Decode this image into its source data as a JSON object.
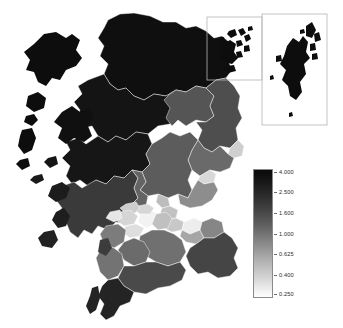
{
  "figure": {
    "type": "choropleth-map",
    "region_name": "Scotland",
    "background_color": "#ffffff",
    "polygon_border_color": "#ffffff"
  },
  "insets": [
    {
      "name": "orkney-inset",
      "x": 207,
      "y": 17,
      "width": 55,
      "height": 63,
      "border_color": "#b4b4b4"
    },
    {
      "name": "shetland-inset",
      "x": 262,
      "y": 14,
      "width": 65,
      "height": 111,
      "border_color": "#b4b4b4"
    }
  ],
  "legend": {
    "orientation": "vertical",
    "scale": "log",
    "x": 253,
    "y": 169,
    "width": 20,
    "height": 129,
    "border_color": "#8a8a8a",
    "top_color": "#0a0a0a",
    "bottom_color": "#fdfdfd",
    "ticks": [
      {
        "label": "4.000",
        "value": 4.0,
        "pos_pct": 2
      },
      {
        "label": "2.500",
        "value": 2.5,
        "pos_pct": 18
      },
      {
        "label": "1.600",
        "value": 1.6,
        "pos_pct": 34
      },
      {
        "label": "1.000",
        "value": 1.0,
        "pos_pct": 50
      },
      {
        "label": "0.625",
        "value": 0.625,
        "pos_pct": 66
      },
      {
        "label": "0.400",
        "value": 0.4,
        "pos_pct": 82
      },
      {
        "label": "0.250",
        "value": 0.25,
        "pos_pct": 97
      }
    ]
  },
  "chart_data": {
    "type": "heatmap",
    "title": "",
    "xlabel": "",
    "ylabel": "",
    "colorbar_label": "",
    "color_scale": "log",
    "vmin": 0.25,
    "vmax": 4.0,
    "colormap": "greys-reversed",
    "legend_position": "right",
    "grid": false,
    "tick_labels": [
      "4.000",
      "2.500",
      "1.600",
      "1.000",
      "0.625",
      "0.400",
      "0.250"
    ],
    "tick_values": [
      4.0,
      2.5,
      1.6,
      1.0,
      0.625,
      0.4,
      0.25
    ],
    "regions": [
      {
        "name": "Shetland Islands",
        "value": 4.0,
        "shade": "#0d0d0d"
      },
      {
        "name": "Orkney Islands",
        "value": 4.0,
        "shade": "#0d0d0d"
      },
      {
        "name": "Na h-Eileanan Siar",
        "value": 4.0,
        "shade": "#0d0d0d"
      },
      {
        "name": "Highland",
        "value": 3.8,
        "shade": "#131313"
      },
      {
        "name": "Sutherland",
        "value": 4.0,
        "shade": "#0f0f0f"
      },
      {
        "name": "Caithness",
        "value": 3.5,
        "shade": "#1a1a1a"
      },
      {
        "name": "Skye and Lochalsh",
        "value": 4.0,
        "shade": "#101010"
      },
      {
        "name": "Lochaber",
        "value": 3.6,
        "shade": "#161616"
      },
      {
        "name": "Ross and Cromarty",
        "value": 3.7,
        "shade": "#141414"
      },
      {
        "name": "Argyll and Bute",
        "value": 2.6,
        "shade": "#3a3a3a"
      },
      {
        "name": "Moray",
        "value": 2.0,
        "shade": "#555555"
      },
      {
        "name": "Aberdeenshire",
        "value": 2.1,
        "shade": "#4e4e4e"
      },
      {
        "name": "Aberdeen City",
        "value": 0.5,
        "shade": "#cfcfcf"
      },
      {
        "name": "Angus",
        "value": 1.6,
        "shade": "#6a6a6a"
      },
      {
        "name": "Perth and Kinross",
        "value": 1.9,
        "shade": "#5c5c5c"
      },
      {
        "name": "Stirling",
        "value": 1.7,
        "shade": "#646464"
      },
      {
        "name": "Dundee City",
        "value": 0.45,
        "shade": "#d8d8d8"
      },
      {
        "name": "Fife",
        "value": 1.1,
        "shade": "#8d8d8d"
      },
      {
        "name": "Clackmannanshire",
        "value": 0.62,
        "shade": "#bdbdbd"
      },
      {
        "name": "Falkirk",
        "value": 0.6,
        "shade": "#c2c2c2"
      },
      {
        "name": "West Lothian",
        "value": 0.55,
        "shade": "#c8c8c8"
      },
      {
        "name": "City of Edinburgh",
        "value": 0.3,
        "shade": "#ededed"
      },
      {
        "name": "Midlothian",
        "value": 0.8,
        "shade": "#a6a6a6"
      },
      {
        "name": "East Lothian",
        "value": 1.2,
        "shade": "#868686"
      },
      {
        "name": "Scottish Borders",
        "value": 2.3,
        "shade": "#454545"
      },
      {
        "name": "Glasgow City",
        "value": 0.26,
        "shade": "#f2f2f2"
      },
      {
        "name": "East Dunbartonshire",
        "value": 0.45,
        "shade": "#d6d6d6"
      },
      {
        "name": "West Dunbartonshire",
        "value": 0.5,
        "shade": "#cdcdcd"
      },
      {
        "name": "Renfrewshire",
        "value": 0.45,
        "shade": "#d5d5d5"
      },
      {
        "name": "East Renfrewshire",
        "value": 0.4,
        "shade": "#dedede"
      },
      {
        "name": "Inverclyde",
        "value": 0.35,
        "shade": "#e6e6e6"
      },
      {
        "name": "North Lanarkshire",
        "value": 0.6,
        "shade": "#c0c0c0"
      },
      {
        "name": "South Lanarkshire",
        "value": 1.5,
        "shade": "#707070"
      },
      {
        "name": "North Ayrshire",
        "value": 1.3,
        "shade": "#7c7c7c"
      },
      {
        "name": "East Ayrshire",
        "value": 1.6,
        "shade": "#6b6b6b"
      },
      {
        "name": "South Ayrshire",
        "value": 1.5,
        "shade": "#737373"
      },
      {
        "name": "Dumfries and Galloway",
        "value": 2.2,
        "shade": "#4a4a4a"
      },
      {
        "name": "Wigtownshire",
        "value": 3.2,
        "shade": "#242424"
      }
    ]
  }
}
